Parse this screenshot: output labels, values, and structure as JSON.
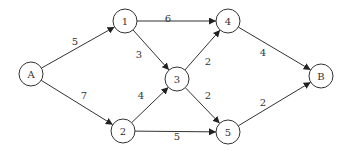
{
  "diagram": {
    "type": "directed-weighted-graph",
    "nodes": [
      {
        "id": "A",
        "label": "A",
        "x": 31,
        "y": 74
      },
      {
        "id": "1",
        "label": "1",
        "x": 125,
        "y": 21
      },
      {
        "id": "2",
        "label": "2",
        "x": 123,
        "y": 131
      },
      {
        "id": "3",
        "label": "3",
        "x": 177,
        "y": 79
      },
      {
        "id": "4",
        "label": "4",
        "x": 228,
        "y": 21
      },
      {
        "id": "5",
        "label": "5",
        "x": 228,
        "y": 132
      },
      {
        "id": "B",
        "label": "B",
        "x": 321,
        "y": 76
      }
    ],
    "edges": [
      {
        "from": "A",
        "to": "1",
        "weight": "5",
        "lx": 75,
        "ly": 45
      },
      {
        "from": "A",
        "to": "2",
        "weight": "7",
        "lx": 84,
        "ly": 99
      },
      {
        "from": "1",
        "to": "4",
        "weight": "6",
        "lx": 168,
        "ly": 22
      },
      {
        "from": "1",
        "to": "3",
        "weight": "3",
        "lx": 139,
        "ly": 58
      },
      {
        "from": "2",
        "to": "3",
        "weight": "4",
        "lx": 141,
        "ly": 99
      },
      {
        "from": "2",
        "to": "5",
        "weight": "5",
        "lx": 177,
        "ly": 140
      },
      {
        "from": "3",
        "to": "4",
        "weight": "2",
        "lx": 208,
        "ly": 65
      },
      {
        "from": "3",
        "to": "5",
        "weight": "2",
        "lx": 208,
        "ly": 99
      },
      {
        "from": "4",
        "to": "B",
        "weight": "4",
        "lx": 263,
        "ly": 56
      },
      {
        "from": "5",
        "to": "B",
        "weight": "2",
        "lx": 263,
        "ly": 106
      }
    ],
    "node_radius": 12
  }
}
